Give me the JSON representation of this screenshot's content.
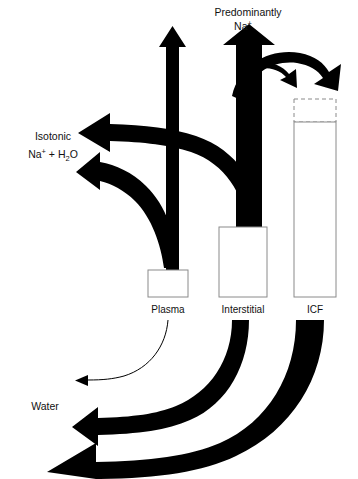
{
  "figure": {
    "background_color": "#ffffff",
    "flow_color": "#000000",
    "box_stroke_color": "#8a8a8a"
  },
  "labels": {
    "top": {
      "line1": "Predominantly",
      "line2_base": "Na",
      "line2_sup": "+"
    },
    "isotonic": {
      "line1": "Isotonic",
      "line2_na": "Na",
      "line2_sup": "+",
      "line2_plus": " + H",
      "line2_sub": "2",
      "line2_o": "O"
    },
    "water": "Water"
  },
  "compartments": [
    {
      "id": "plasma",
      "label": "Plasma",
      "x": 148,
      "y": 270,
      "width": 40,
      "height": 27,
      "dashed_top": false
    },
    {
      "id": "interstitial",
      "label": "Interstitial",
      "x": 219,
      "y": 227,
      "width": 48,
      "height": 70,
      "dashed_top": false
    },
    {
      "id": "icf",
      "label": "ICF",
      "x": 294,
      "y": 122,
      "width": 42,
      "height": 175,
      "dashed_top": true,
      "dashed_height": 23
    }
  ],
  "flows": [
    {
      "id": "plasma-na-up",
      "from": "plasma",
      "to": "Predominantly Na+",
      "direction": "up",
      "weight": "thin",
      "arrowhead": "up"
    },
    {
      "id": "interstitial-na-up",
      "from": "interstitial",
      "to": "Predominantly Na+",
      "direction": "up",
      "weight": "thick",
      "arrowhead": "up"
    },
    {
      "id": "interstitial-to-icf",
      "from": "interstitial",
      "to": "icf",
      "direction": "curve-right-down",
      "weight": "medium",
      "arrowhead": "down-right"
    },
    {
      "id": "interstitial-out-right",
      "from": "interstitial",
      "to": "external",
      "direction": "curve-right-down",
      "weight": "thick",
      "arrowhead": "down-right"
    },
    {
      "id": "interstitial-isotonic-out",
      "from": "interstitial",
      "to": "Isotonic Na+ + H2O",
      "direction": "left",
      "weight": "thick",
      "arrowhead": "left"
    },
    {
      "id": "plasma-isotonic-out",
      "from": "plasma",
      "to": "Isotonic Na+ + H2O",
      "direction": "left",
      "weight": "medium",
      "arrowhead": "left"
    },
    {
      "id": "plasma-water-out",
      "from": "plasma",
      "to": "Water",
      "direction": "curve-left",
      "weight": "hairline",
      "arrowhead": "left"
    },
    {
      "id": "interstitial-water-out",
      "from": "interstitial",
      "to": "Water",
      "direction": "curve-left",
      "weight": "medium",
      "arrowhead": "left"
    },
    {
      "id": "icf-water-out",
      "from": "icf",
      "to": "Water",
      "direction": "curve-left",
      "weight": "very-thick",
      "arrowhead": "left"
    }
  ]
}
